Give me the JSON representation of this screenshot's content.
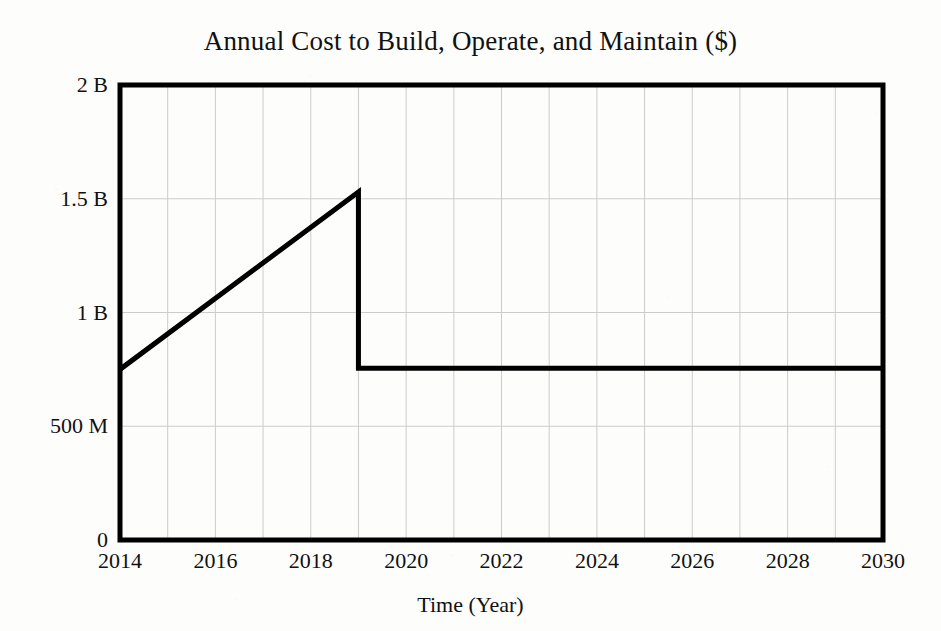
{
  "chart_data": {
    "type": "line",
    "title": "Annual Cost to Build, Operate, and Maintain ($)",
    "xlabel": "Time (Year)",
    "ylabel": "",
    "xlim": [
      2014,
      2030
    ],
    "ylim": [
      0,
      2000000000
    ],
    "grid": true,
    "legend": null,
    "y_tick_values": [
      0,
      500000000,
      1000000000,
      1500000000,
      2000000000
    ],
    "y_tick_labels": [
      "0",
      "500 M",
      "1 B",
      "1.5 B",
      "2 B"
    ],
    "x_tick_values": [
      2014,
      2016,
      2018,
      2020,
      2022,
      2024,
      2026,
      2028,
      2030
    ],
    "x_tick_labels": [
      "2014",
      "2016",
      "2018",
      "2020",
      "2022",
      "2024",
      "2026",
      "2028",
      "2030"
    ],
    "x_minor_step": 1,
    "series": [
      {
        "name": "Annual Cost",
        "color": "#000000",
        "line_width": 5,
        "x": [
          2014,
          2019,
          2019,
          2030
        ],
        "y": [
          750000000,
          1530000000,
          755000000,
          755000000
        ],
        "points": [
          {
            "x": 2014,
            "y": 750000000,
            "note": "construction period start"
          },
          {
            "x": 2019,
            "y": 1530000000,
            "note": "peak of build phase"
          },
          {
            "x": 2019,
            "y": 755000000,
            "note": "drop to steady-state operations"
          },
          {
            "x": 2030,
            "y": 755000000,
            "note": "steady operate and maintain cost"
          }
        ]
      }
    ],
    "annotations": []
  },
  "colors": {
    "line": "#000000",
    "axis": "#000000",
    "grid": "#cccccc",
    "background": "#fdfdfc",
    "text": "#111111"
  },
  "axes": {
    "title": "Annual Cost to Build, Operate, and Maintain ($)",
    "xlabel": "Time (Year)"
  },
  "yticks": [
    {
      "label": "2 B"
    },
    {
      "label": "1.5 B"
    },
    {
      "label": "1 B"
    },
    {
      "label": "500 M"
    },
    {
      "label": "0"
    }
  ],
  "xticks": [
    {
      "label": "2014"
    },
    {
      "label": "2016"
    },
    {
      "label": "2018"
    },
    {
      "label": "2020"
    },
    {
      "label": "2022"
    },
    {
      "label": "2024"
    },
    {
      "label": "2026"
    },
    {
      "label": "2028"
    },
    {
      "label": "2030"
    }
  ]
}
